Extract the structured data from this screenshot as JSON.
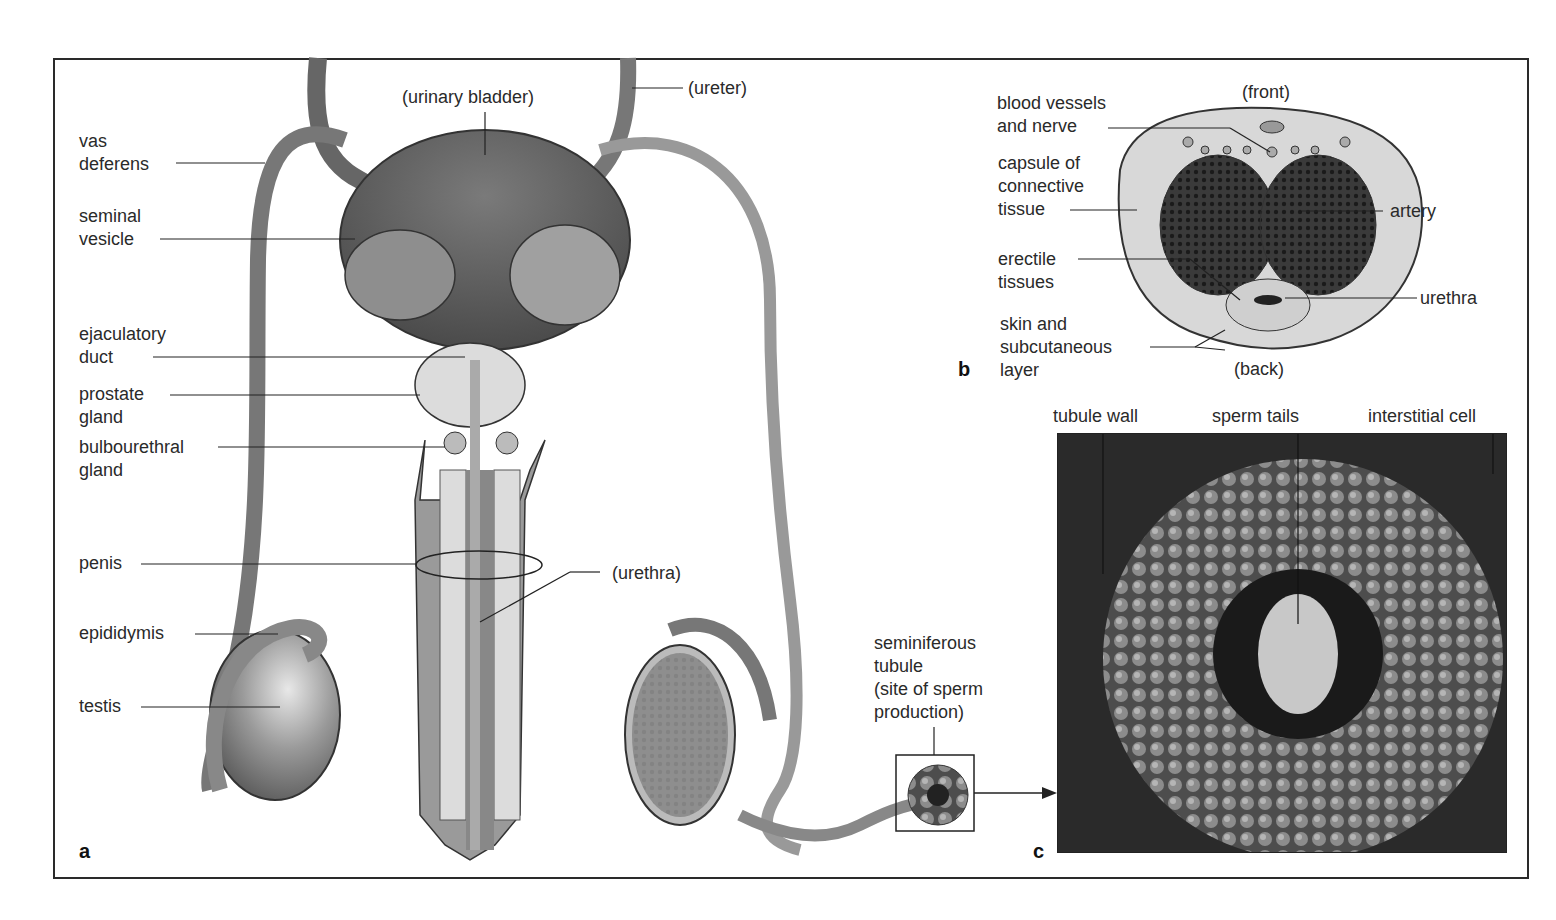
{
  "figure": {
    "panels": {
      "a": "a",
      "b": "b",
      "c": "c"
    },
    "panel_a": {
      "labels_left": {
        "vas_deferens": "vas\ndeferens",
        "seminal_vesicle": "seminal\nvesicle",
        "ejaculatory_duct": "ejaculatory\nduct",
        "prostate_gland": "prostate\ngland",
        "bulbourethral_gland": "bulbourethral\ngland",
        "penis": "penis",
        "epididymis": "epididymis",
        "testis": "testis"
      },
      "labels_other": {
        "urinary_bladder": "(urinary bladder)",
        "ureter": "(ureter)",
        "urethra": "(urethra)",
        "seminiferous_tubule": "seminiferous\ntubule\n(site of sperm\nproduction)"
      }
    },
    "panel_b": {
      "front": "(front)",
      "back": "(back)",
      "blood_vessels": "blood vessels\nand nerve",
      "capsule": "capsule of\nconnective\ntissue",
      "erectile": "erectile\ntissues",
      "skin": "skin and\nsubcutaneous\nlayer",
      "artery": "artery",
      "urethra": "urethra"
    },
    "panel_c": {
      "tubule_wall": "tubule wall",
      "sperm_tails": "sperm  tails",
      "interstitial_cell": "interstitial  cell"
    },
    "colors": {
      "ink": "#2a2a2a",
      "tissue_dark": "#555555",
      "tissue_mid": "#8a8a8a",
      "tissue_light": "#d6d6d6"
    }
  }
}
